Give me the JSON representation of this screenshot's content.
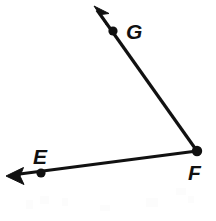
{
  "figure": {
    "type": "geometry-diagram",
    "background_color": "#ffffff",
    "stroke_color": "#111111",
    "canvas": {
      "width": 216,
      "height": 221
    }
  },
  "points": [
    {
      "id": "E",
      "label": "E",
      "dot": {
        "x": 41,
        "y": 173,
        "r": 4.2
      },
      "label_pos": {
        "x": 33,
        "y": 164
      }
    },
    {
      "id": "F",
      "label": "F",
      "dot": {
        "x": 197,
        "y": 151,
        "r": 5.0
      },
      "label_pos": {
        "x": 188,
        "y": 180
      }
    },
    {
      "id": "G",
      "label": "G",
      "dot": {
        "x": 113,
        "y": 31,
        "r": 4.2
      },
      "label_pos": {
        "x": 126,
        "y": 39
      }
    }
  ],
  "rays": [
    {
      "id": "FG",
      "name": "ray-fg",
      "from": {
        "x": 197,
        "y": 151
      },
      "to": {
        "x": 97,
        "y": 10
      },
      "arrow_tip": {
        "x": 94,
        "y": 6
      },
      "arrow_points": "94,6 108,13 101,14 106,24",
      "through_point": "G"
    },
    {
      "id": "FE",
      "name": "ray-fe",
      "from": {
        "x": 197,
        "y": 151
      },
      "to": {
        "x": 12,
        "y": 175
      },
      "arrow_tip": {
        "x": 6,
        "y": 176
      },
      "arrow_points": "6,176 22,168 19,176 23,184",
      "through_point": "E"
    }
  ],
  "artifacts": [
    {
      "x": 26,
      "y": 200,
      "w": 7,
      "h": 9
    },
    {
      "x": 40,
      "y": 196,
      "w": 9,
      "h": 8
    },
    {
      "x": 62,
      "y": 198,
      "w": 6,
      "h": 8
    },
    {
      "x": 100,
      "y": 205,
      "w": 10,
      "h": 6
    },
    {
      "x": 146,
      "y": 198,
      "w": 12,
      "h": 9
    },
    {
      "x": 176,
      "y": 188,
      "w": 10,
      "h": 7
    },
    {
      "x": 188,
      "y": 196,
      "w": 6,
      "h": 7
    }
  ]
}
